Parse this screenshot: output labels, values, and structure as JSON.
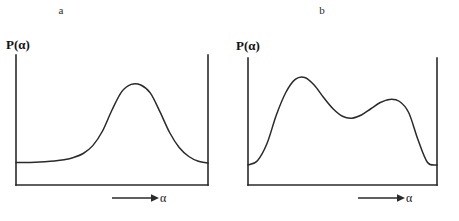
{
  "figure": {
    "background_color": "#ffffff",
    "ink_color": "#2a2a2a",
    "caption_fragment": ""
  },
  "panels": [
    {
      "id": "a",
      "label": "a",
      "y_axis_label": "P(α)",
      "x_axis_label": "α",
      "arrow_icon": "right-arrow-icon"
    },
    {
      "id": "b",
      "label": "b",
      "y_axis_label": "P(α)",
      "x_axis_label": "α",
      "arrow_icon": "right-arrow-icon"
    }
  ],
  "chart_data": [
    {
      "type": "line",
      "id": "panel-a",
      "title": "a",
      "xlabel": "α",
      "ylabel": "P(α)",
      "xlim": [
        0,
        1
      ],
      "ylim": [
        0,
        1
      ],
      "grid": false,
      "legend": "none",
      "axis_ticks": "none",
      "description": "Unimodal (single-peaked) probability distribution with a low flat baseline rising to one broad central peak and falling back to baseline.",
      "series": [
        {
          "name": "P(alpha) unimodal",
          "x": [
            0.0,
            0.05,
            0.1,
            0.15,
            0.2,
            0.25,
            0.3,
            0.35,
            0.4,
            0.45,
            0.5,
            0.55,
            0.6,
            0.65,
            0.7,
            0.75,
            0.8,
            0.85,
            0.9,
            0.95,
            1.0
          ],
          "y": [
            0.18,
            0.18,
            0.182,
            0.186,
            0.192,
            0.202,
            0.22,
            0.252,
            0.315,
            0.43,
            0.6,
            0.745,
            0.805,
            0.8,
            0.735,
            0.585,
            0.42,
            0.3,
            0.228,
            0.19,
            0.175
          ]
        }
      ]
    },
    {
      "type": "line",
      "id": "panel-b",
      "title": "b",
      "xlabel": "α",
      "ylabel": "P(α)",
      "xlim": [
        0,
        1
      ],
      "ylim": [
        0,
        1
      ],
      "grid": false,
      "legend": "none",
      "axis_ticks": "none",
      "description": "Bimodal probability distribution: a tall sharp first peak near the left, a shallow trough, a lower broad second peak, then a steep drop to a low right baseline.",
      "series": [
        {
          "name": "P(alpha) bimodal",
          "x": [
            0.0,
            0.05,
            0.1,
            0.15,
            0.2,
            0.25,
            0.3,
            0.35,
            0.4,
            0.45,
            0.5,
            0.55,
            0.6,
            0.65,
            0.7,
            0.75,
            0.8,
            0.85,
            0.9,
            0.95,
            1.0
          ],
          "y": [
            0.16,
            0.195,
            0.33,
            0.56,
            0.74,
            0.845,
            0.86,
            0.8,
            0.7,
            0.61,
            0.55,
            0.535,
            0.56,
            0.61,
            0.66,
            0.685,
            0.67,
            0.58,
            0.36,
            0.18,
            0.16
          ]
        }
      ]
    }
  ]
}
